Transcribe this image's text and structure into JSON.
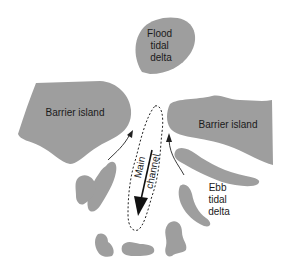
{
  "diagram": {
    "colors": {
      "land": "#9e9e9e",
      "text": "#1a1a1a",
      "line": "#222222",
      "background": "#ffffff"
    },
    "labels": {
      "flood_delta": [
        "Flood",
        "tidal",
        "delta"
      ],
      "barrier_left": "Barrier island",
      "barrier_right": "Barrier island",
      "channel": [
        "Main",
        "channel"
      ],
      "ebb_delta": [
        "Ebb",
        "tidal",
        "delta"
      ]
    }
  }
}
